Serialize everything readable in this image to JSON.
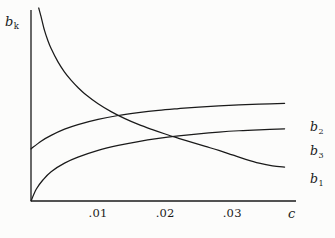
{
  "chart_data": {
    "type": "line",
    "title": "",
    "xlabel": "c",
    "ylabel": "b_k",
    "ylabel_base": "b",
    "ylabel_sub": "k",
    "xlim": [
      0,
      0.0395
    ],
    "ylim": [
      0,
      1
    ],
    "grid": false,
    "legend_position": "right-inline",
    "xticks": [
      0.01,
      0.02,
      0.03
    ],
    "xticklabels": [
      ".01",
      ".02",
      ".03"
    ],
    "yticks": [],
    "yticklabels": [],
    "axis_color": "#1a1a1a",
    "curve_color": "#1a1a1a",
    "series": [
      {
        "name": "b_1",
        "label_base": "b",
        "label_sub": "1",
        "description": "decreasing hyperbolic curve, starts very high near c=0 and decays toward a low plateau",
        "x": [
          0.00115,
          0.0015,
          0.002,
          0.0025,
          0.003,
          0.004,
          0.005,
          0.006,
          0.007,
          0.008,
          0.01,
          0.012,
          0.014,
          0.016,
          0.018,
          0.02,
          0.022,
          0.024,
          0.026,
          0.028,
          0.03,
          0.032,
          0.034,
          0.036,
          0.0378
        ],
        "y": [
          1.0,
          0.955,
          0.885,
          0.833,
          0.79,
          0.722,
          0.668,
          0.625,
          0.588,
          0.556,
          0.504,
          0.462,
          0.427,
          0.397,
          0.371,
          0.347,
          0.325,
          0.304,
          0.283,
          0.262,
          0.239,
          0.216,
          0.196,
          0.182,
          0.176
        ]
      },
      {
        "name": "b_2",
        "label_base": "b",
        "label_sub": "2",
        "description": "increasing concave curve rising from a moderate value to a high plateau",
        "x": [
          0.0,
          0.0015,
          0.003,
          0.005,
          0.007,
          0.01,
          0.013,
          0.016,
          0.019,
          0.022,
          0.025,
          0.028,
          0.031,
          0.034,
          0.0378
        ],
        "y": [
          0.27,
          0.31,
          0.34,
          0.372,
          0.396,
          0.423,
          0.443,
          0.458,
          0.47,
          0.479,
          0.487,
          0.493,
          0.498,
          0.502,
          0.506
        ]
      },
      {
        "name": "b_3",
        "label_base": "b",
        "label_sub": "3",
        "description": "increasing concave curve rising from zero at the origin to a mid plateau",
        "x": [
          0.0,
          0.0008,
          0.0018,
          0.003,
          0.005,
          0.007,
          0.01,
          0.013,
          0.016,
          0.019,
          0.022,
          0.025,
          0.028,
          0.031,
          0.034,
          0.0378
        ],
        "y": [
          0.0,
          0.062,
          0.11,
          0.152,
          0.196,
          0.227,
          0.262,
          0.288,
          0.308,
          0.324,
          0.337,
          0.348,
          0.357,
          0.364,
          0.369,
          0.374
        ]
      }
    ],
    "annotations": [
      {
        "text": "b2 crosses b1",
        "x": 0.0142,
        "y": 0.434
      },
      {
        "text": "b3 crosses b1",
        "x": 0.0205,
        "y": 0.329
      }
    ]
  },
  "labels": {
    "ylabel_base": "b",
    "ylabel_sub": "k",
    "xlabel": "c",
    "tick_0": ".01",
    "tick_1": ".02",
    "tick_2": ".03",
    "b2_base": "b",
    "b2_sub": "2",
    "b3_base": "b",
    "b3_sub": "3",
    "b1_base": "b",
    "b1_sub": "1"
  }
}
